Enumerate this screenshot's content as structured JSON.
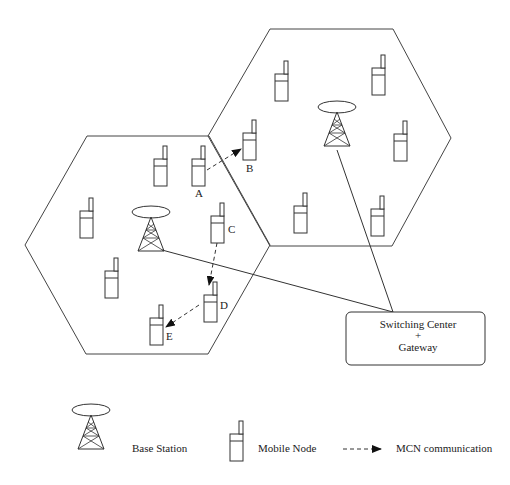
{
  "diagram": {
    "title": "",
    "cells": [
      {
        "id": "left-cell",
        "has_base_station": true
      },
      {
        "id": "right-cell",
        "has_base_station": true
      }
    ],
    "node_labels": {
      "A": "A",
      "B": "B",
      "C": "C",
      "D": "D",
      "E": "E"
    },
    "switching_center": {
      "line1": "Switching Center",
      "line2": "+",
      "line3": "Gateway"
    },
    "mcn_links": [
      {
        "from": "A",
        "to": "B"
      },
      {
        "from": "C",
        "to": "D"
      },
      {
        "from": "D",
        "to": "E"
      }
    ],
    "connections": [
      {
        "from": "left-base-station",
        "to": "switching-center"
      },
      {
        "from": "right-base-station",
        "to": "switching-center"
      }
    ],
    "mobile_node_count": {
      "left_cell": 8,
      "right_cell": 6
    },
    "legend": {
      "base_station": "Base Station",
      "mobile_node": "Mobile Node",
      "mcn": "MCN communication"
    },
    "colors": {
      "stroke": "#333333",
      "background": "#ffffff"
    }
  }
}
